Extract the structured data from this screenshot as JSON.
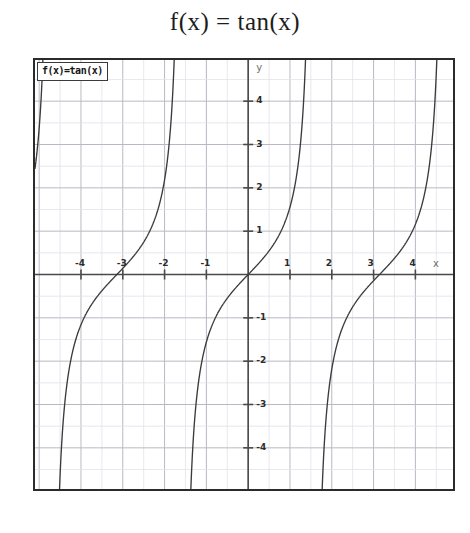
{
  "title": "f(x) = tan(x)",
  "legend": {
    "label": "f(x)=tan(x)"
  },
  "axes": {
    "x_name": "x",
    "y_name": "y"
  },
  "colors": {
    "curve": "#3b3b3b",
    "axis": "#4a4a4a",
    "major_grid": "#b9b9c4",
    "minor_grid": "#e2e2ea",
    "frame": "#2b2b2b",
    "text": "#2b2b2b",
    "background": "#ffffff"
  },
  "chart_data": {
    "type": "line",
    "title": "f(x) = tan(x)",
    "xlabel": "x",
    "ylabel": "y",
    "function": "tan(x)",
    "xlim": [
      -5.1,
      4.9
    ],
    "ylim": [
      -4.95,
      4.95
    ],
    "grid": true,
    "major_grid_step": 1,
    "minor_grid_step": 0.5,
    "legend": "f(x)=tan(x)",
    "legend_position": "top-left",
    "xticks": [
      -4,
      -3,
      -2,
      -1,
      1,
      2,
      3,
      4
    ],
    "xtick_labels": [
      "-4",
      "-3",
      "-2",
      "-1",
      "1",
      "2",
      "3",
      "4"
    ],
    "yticks": [
      4,
      3,
      2,
      1,
      -1,
      -2,
      -3,
      -4
    ],
    "ytick_labels": [
      "4",
      "3",
      "2",
      "1",
      "-1",
      "-2",
      "-3",
      "-4"
    ],
    "asymptotes": [
      -4.712,
      -1.571,
      1.571,
      4.712
    ],
    "zero_crossings": [
      -3.142,
      0,
      3.142
    ],
    "branches": [
      {
        "name": "branch-left-outer",
        "x_range": [
          -4.712,
          -3.142
        ],
        "note": "rises from -inf at x=-3pi/2 through zero at x=-pi"
      },
      {
        "name": "branch-left-inner",
        "x_range": [
          -3.142,
          -1.571
        ],
        "note": "rises from zero at x=-pi to +inf at x=-pi/2"
      },
      {
        "name": "branch-center",
        "x_range": [
          -1.571,
          1.571
        ],
        "note": "rises from -inf at x=-pi/2 through origin to +inf at x=pi/2"
      },
      {
        "name": "branch-right",
        "x_range": [
          1.571,
          4.712
        ],
        "note": "rises from -inf at x=pi/2 through zero at x=pi toward +inf at x=3pi/2"
      }
    ],
    "sample_points": [
      {
        "x": -4.6,
        "y": -8.86
      },
      {
        "x": -4.0,
        "y": -1.158
      },
      {
        "x": -3.5,
        "y": -0.375
      },
      {
        "x": -3.142,
        "y": 0.0
      },
      {
        "x": -2.5,
        "y": 0.747
      },
      {
        "x": -2.0,
        "y": 2.185
      },
      {
        "x": -1.7,
        "y": 7.697
      },
      {
        "x": -1.4,
        "y": -5.798
      },
      {
        "x": -1.0,
        "y": -1.557
      },
      {
        "x": -0.5,
        "y": -0.546
      },
      {
        "x": 0.0,
        "y": 0.0
      },
      {
        "x": 0.5,
        "y": 0.546
      },
      {
        "x": 1.0,
        "y": 1.557
      },
      {
        "x": 1.4,
        "y": 5.798
      },
      {
        "x": 1.8,
        "y": -4.286
      },
      {
        "x": 2.5,
        "y": -0.747
      },
      {
        "x": 3.142,
        "y": 0.0
      },
      {
        "x": 3.5,
        "y": 0.375
      },
      {
        "x": 4.0,
        "y": 1.158
      },
      {
        "x": 4.5,
        "y": 4.637
      },
      {
        "x": 4.65,
        "y": 14.3
      }
    ]
  }
}
